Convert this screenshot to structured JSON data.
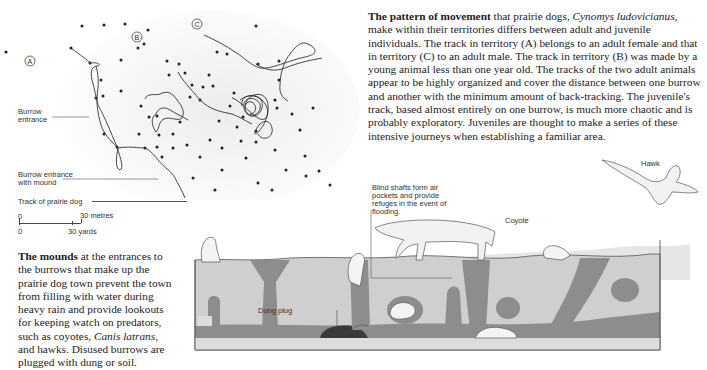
{
  "map": {
    "territories": [
      "A",
      "B",
      "C"
    ],
    "labels": {
      "burrow_entrance": "Burrow entrance",
      "burrow_entrance_mound": "Burrow entrance with mound",
      "track": "Track of prairie dog"
    },
    "scale": {
      "metric_start": "0",
      "metric_end": "30 metres",
      "imperial_start": "0",
      "imperial_end": "30 yards"
    }
  },
  "pattern_text": {
    "lead": "The pattern of movement",
    "rest_1": " that prairie dogs, ",
    "species": "Cynomys ludovicianus",
    "rest_2": ", make within their territories differs between adult and juvenile individuals. The track in territory (A) belongs to an adult female and that in territory (C) to an adult male. The track in territory (B) was made by a young animal less than one year old. The tracks of the two adult animals appear to be highly organized and cover the distance between one burrow and another with the minimum amount of back-tracking. The juvenile's track, based almost entirely on one burrow, is much more chaotic and is probably exploratory. Juveniles are thought to make a series of these intensive journeys when establishing a familiar area."
  },
  "mounds_text": {
    "lead": "The mounds",
    "rest_1": " at the entrances to the burrows that make up the prairie dog town prevent the town from filling with water during heavy rain and provide lookouts for keeping watch on predators, such as coyotes, ",
    "species": "Canis latrans",
    "rest_2": ", and hawks. Disused burrows are plugged with dung or soil."
  },
  "diagram": {
    "blind_shafts": "Blind shafts form air pockets and provide refuges in the event of flooding.",
    "dung_plug": "Dung plug",
    "coyote": "Coyote",
    "hawk": "Hawk"
  },
  "colors": {
    "soil": "#c9c9c9",
    "tunnel": "#8a8a8a",
    "sky_ground": "#e4e4e4"
  }
}
